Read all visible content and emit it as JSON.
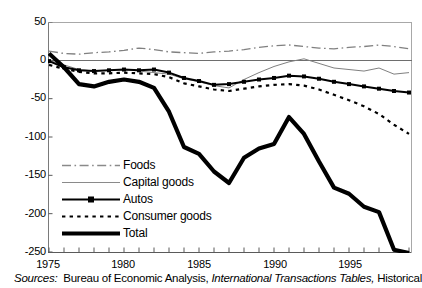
{
  "chart_data": {
    "type": "line",
    "title": "",
    "xlabel": "",
    "ylabel": "",
    "xlim": [
      1975,
      1999
    ],
    "ylim": [
      -250,
      50
    ],
    "grid": false,
    "zero_line": true,
    "legend_position": "lower-left-inside",
    "x": [
      1975,
      1976,
      1977,
      1978,
      1979,
      1980,
      1981,
      1982,
      1983,
      1984,
      1985,
      1986,
      1987,
      1988,
      1989,
      1990,
      1991,
      1992,
      1993,
      1994,
      1995,
      1996,
      1997,
      1998,
      1999
    ],
    "xticks": [
      1975,
      1980,
      1985,
      1990,
      1995
    ],
    "yticks": [
      50,
      0,
      -50,
      -100,
      -150,
      -200,
      -250
    ],
    "series": [
      {
        "name": "Foods",
        "style": "dash-dot",
        "color": "#808080",
        "values": [
          12,
          9,
          8,
          10,
          11,
          13,
          16,
          14,
          11,
          10,
          9,
          11,
          12,
          14,
          17,
          19,
          20,
          18,
          16,
          15,
          17,
          18,
          20,
          18,
          15
        ]
      },
      {
        "name": "Capital goods",
        "style": "thin-solid",
        "color": "#808080",
        "values": [
          0,
          -6,
          -12,
          -14,
          -13,
          -12,
          -14,
          -16,
          -18,
          -24,
          -28,
          -33,
          -36,
          -25,
          -16,
          -8,
          -2,
          2,
          -4,
          -10,
          -12,
          -14,
          -10,
          -18,
          -16
        ]
      },
      {
        "name": "Autos",
        "style": "solid-marker",
        "color": "#000000",
        "values": [
          -1,
          -9,
          -13,
          -14,
          -13,
          -12,
          -13,
          -12,
          -16,
          -23,
          -27,
          -32,
          -31,
          -28,
          -25,
          -23,
          -20,
          -21,
          -24,
          -28,
          -31,
          -34,
          -37,
          -40,
          -42
        ]
      },
      {
        "name": "Consumer goods",
        "style": "dotted",
        "color": "#000000",
        "values": [
          -6,
          -11,
          -15,
          -17,
          -17,
          -16,
          -17,
          -18,
          -22,
          -30,
          -34,
          -38,
          -40,
          -37,
          -34,
          -32,
          -31,
          -33,
          -38,
          -45,
          -52,
          -60,
          -70,
          -84,
          -96
        ]
      },
      {
        "name": "Total",
        "style": "thick-solid",
        "color": "#000000",
        "values": [
          9,
          -9,
          -31,
          -34,
          -28,
          -25,
          -28,
          -36,
          -67,
          -113,
          -122,
          -145,
          -160,
          -127,
          -115,
          -109,
          -74,
          -96,
          -132,
          -166,
          -174,
          -191,
          -198,
          -247,
          -346
        ]
      }
    ]
  },
  "legend": {
    "items": [
      {
        "label": "Foods",
        "key": "line-key-foods"
      },
      {
        "label": "Capital goods",
        "key": "line-key-capital-goods"
      },
      {
        "label": "Autos",
        "key": "line-key-autos"
      },
      {
        "label": "Consumer goods",
        "key": "line-key-consumer-goods"
      },
      {
        "label": "Total",
        "key": "line-key-total"
      }
    ]
  },
  "axes": {
    "y_labels": [
      "50",
      "0",
      "-50",
      "-100",
      "-150",
      "-200",
      "-250"
    ],
    "x_labels": [
      "1975",
      "1980",
      "1985",
      "1990",
      "1995"
    ]
  },
  "source": {
    "prefix": "Sources:",
    "text_before": "Bureau of Economic Analysis,",
    "italic": "International Transactions Tables,",
    "text_after": "Historical"
  }
}
